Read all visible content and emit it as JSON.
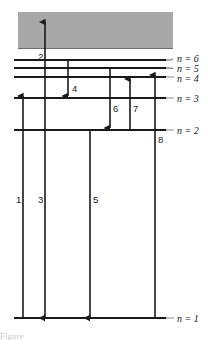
{
  "figure": {
    "type": "energy-level-diagram",
    "background_color": "#ffffff",
    "line_color": "#1a1a1a",
    "band_color": "#a8a8a8",
    "caption_fragment": "Figure"
  },
  "continuum_band": {
    "name": "ionization-continuum",
    "x": 18,
    "y": 12,
    "width": 155,
    "height": 36,
    "color": "#a8a8a8"
  },
  "levels": [
    {
      "id": "n6",
      "label": "n = 6",
      "n": 6,
      "y": 60,
      "x_start": 14,
      "x_end": 166,
      "leader": true,
      "label_x": 177,
      "label_y": 62
    },
    {
      "id": "n5",
      "label": "n = 5",
      "n": 5,
      "y": 68,
      "x_start": 14,
      "x_end": 166,
      "leader": true,
      "label_x": 177,
      "label_y": 72
    },
    {
      "id": "n4",
      "label": "n = 4",
      "n": 4,
      "y": 77,
      "x_start": 14,
      "x_end": 166,
      "leader": false,
      "label_x": 177,
      "label_y": 82
    },
    {
      "id": "n3",
      "label": "n = 3",
      "n": 3,
      "y": 98,
      "x_start": 14,
      "x_end": 166,
      "leader": false,
      "label_x": 177,
      "label_y": 102
    },
    {
      "id": "n2",
      "label": "n = 2",
      "n": 2,
      "y": 130,
      "x_start": 14,
      "x_end": 166,
      "leader": false,
      "label_x": 177,
      "label_y": 134
    },
    {
      "id": "n1",
      "label": "n = 1",
      "n": 1,
      "y": 318,
      "x_start": 14,
      "x_end": 166,
      "leader": false,
      "label_x": 177,
      "label_y": 322
    }
  ],
  "transitions": [
    {
      "id": "t1",
      "label": "1",
      "x": 23,
      "y_from": 318,
      "y_to": 96,
      "direction": "up",
      "label_x": 16,
      "label_y": 203,
      "from_level": "n = 1",
      "to_level": "n = 3"
    },
    {
      "id": "t2",
      "label": "2",
      "x": 45,
      "y_from": 98,
      "y_to": 22,
      "direction": "up",
      "label_x": 38,
      "label_y": 60,
      "from_level": "n = 3",
      "to_level": "continuum"
    },
    {
      "id": "t3",
      "label": "3",
      "x": 45,
      "y_from": 98,
      "y_to": 318,
      "direction": "down",
      "label_x": 38,
      "label_y": 203,
      "from_level": "n = 3",
      "to_level": "n = 1"
    },
    {
      "id": "t4",
      "label": "4",
      "x": 68,
      "y_from": 60,
      "y_to": 96,
      "direction": "down",
      "label_x": 72,
      "label_y": 92,
      "from_level": "n = 6",
      "to_level": "n = 3"
    },
    {
      "id": "t5",
      "label": "5",
      "x": 90,
      "y_from": 130,
      "y_to": 318,
      "direction": "down",
      "label_x": 93,
      "label_y": 203,
      "from_level": "n = 2",
      "to_level": "n = 1"
    },
    {
      "id": "t6",
      "label": "6",
      "x": 110,
      "y_from": 68,
      "y_to": 128,
      "direction": "down",
      "label_x": 113,
      "label_y": 112,
      "from_level": "n = 5",
      "to_level": "n = 2"
    },
    {
      "id": "t7",
      "label": "7",
      "x": 130,
      "y_from": 130,
      "y_to": 79,
      "direction": "up",
      "label_x": 133,
      "label_y": 112,
      "from_level": "n = 2",
      "to_level": "n = 4"
    },
    {
      "id": "t8",
      "label": "8",
      "x": 155,
      "y_from": 318,
      "y_to": 75,
      "direction": "up",
      "label_x": 158,
      "label_y": 143,
      "from_level": "n = 1",
      "to_level": "n = 4"
    }
  ]
}
